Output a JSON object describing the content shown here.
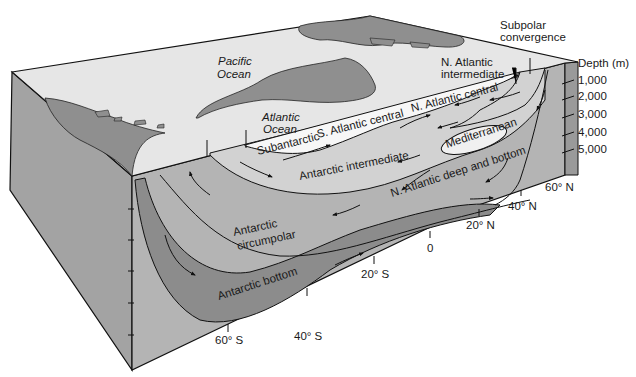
{
  "surface_labels": {
    "pacific": [
      "Pacific",
      "Ocean"
    ],
    "atlantic": [
      "Atlantic",
      "Ocean"
    ]
  },
  "water_masses": {
    "subantarctic": "Subantarctic",
    "s_atlantic_central": "S. Atlantic central",
    "n_atlantic_central": "N. Atlantic central",
    "n_atlantic_intermediate": [
      "N. Atlantic",
      "intermediate"
    ],
    "subpolar_convergence": [
      "Subpolar",
      "convergence"
    ],
    "antarctic_intermediate": "Antarctic intermediate",
    "mediterranean": "Mediterranean",
    "n_atlantic_deep_bottom": "N. Atlantic deep and bottom",
    "antarctic_circumpolar": [
      "Antarctic",
      "circumpolar"
    ],
    "antarctic_bottom": "Antarctic bottom"
  },
  "depth_axis": {
    "title": "Depth (m)",
    "ticks": [
      "1,000",
      "2,000",
      "3,000",
      "4,000",
      "5,000"
    ]
  },
  "latitude_axis": {
    "ticks": [
      "60° S",
      "40° S",
      "20° S",
      "0",
      "20° N",
      "40° N",
      "60° N"
    ]
  },
  "colors": {
    "surface": "#e6e6e6",
    "land": "#8f8f8f",
    "side_face": "#a3a3a3",
    "section_base": "#b4b4b4",
    "light_water": "#d2d2d2",
    "mid_water": "#b0b0b0",
    "dark_water": "#8c8c8c",
    "white_lens": "#f7f7f7",
    "outline": "#111111"
  }
}
